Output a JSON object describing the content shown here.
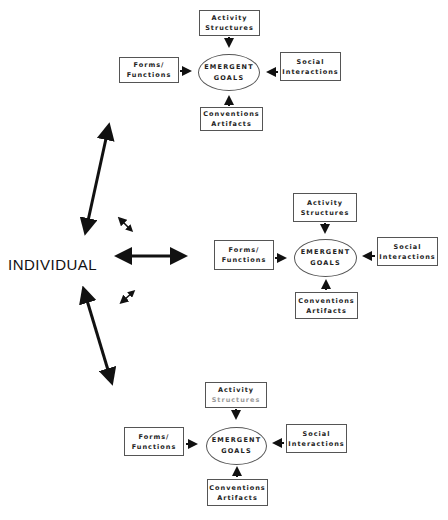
{
  "center_label": "INDIVIDUAL",
  "diagrams": [
    {
      "activity": [
        "Activity",
        "Structures"
      ],
      "forms": [
        "Forms/",
        "Functions"
      ],
      "goals": [
        "EMERGENT",
        "GOALS"
      ],
      "social": [
        "Social",
        "Interactions"
      ],
      "conventions": [
        "Conventions",
        "Artifacts"
      ]
    },
    {
      "activity": [
        "Activity",
        "Structures"
      ],
      "forms": [
        "Forms/",
        "Functions"
      ],
      "goals": [
        "EMERGENT",
        "GOALS"
      ],
      "social": [
        "Social",
        "Interactions"
      ],
      "conventions": [
        "Conventions",
        "Artifacts"
      ]
    },
    {
      "activity": [
        "Activity",
        "Structures"
      ],
      "forms": [
        "Forms/",
        "Functions"
      ],
      "goals": [
        "EMERGENT",
        "GOALS"
      ],
      "social": [
        "Social",
        "Interactions"
      ],
      "conventions": [
        "Conventions",
        "Artifacts"
      ]
    }
  ],
  "arrows": {
    "up_long": "double-headed arrow to top diagram",
    "mid_long": "double-headed arrow to middle diagram",
    "down_long": "double-headed arrow to bottom diagram",
    "small_upper": "small double-headed arrow",
    "small_lower": "small double-headed arrow"
  }
}
